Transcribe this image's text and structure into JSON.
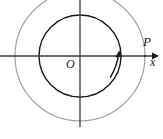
{
  "figure": {
    "type": "geometry-diagram",
    "width": 163,
    "height": 139,
    "background_color": "#ffffff"
  },
  "labels": {
    "origin": "O",
    "point": "P",
    "axis_x": "x"
  },
  "colors": {
    "axis": "#3a3a3a",
    "inner_circle": "#1a1a1a",
    "outer_circle": "#9a9a9a",
    "arrow": "#1a1a1a",
    "text": "#1a1a1a"
  },
  "geometry": {
    "center": {
      "x": 80,
      "y": 56
    },
    "inner_circle_radius": 41,
    "outer_circle_radius": 65,
    "x_axis": {
      "x1": 0,
      "y1": 56,
      "x2": 159,
      "y2": 56
    },
    "y_axis": {
      "x1": 80,
      "y1": 0,
      "x2": 80,
      "y2": 127
    },
    "point_P": {
      "x": 145,
      "y": 56
    },
    "motion_arrow": {
      "direction": "counterclockwise",
      "tip": {
        "x": 119,
        "y": 52
      },
      "tail": {
        "x": 110,
        "y": 76
      }
    }
  }
}
